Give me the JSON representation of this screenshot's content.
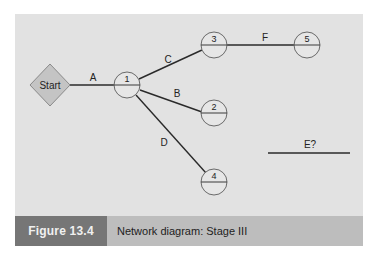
{
  "diagram": {
    "start_label": "Start",
    "nodes": [
      {
        "id": "1",
        "label": "1"
      },
      {
        "id": "2",
        "label": "2"
      },
      {
        "id": "3",
        "label": "3"
      },
      {
        "id": "4",
        "label": "4"
      },
      {
        "id": "5",
        "label": "5"
      }
    ],
    "edges": [
      {
        "label": "A",
        "from": "Start",
        "to": "1"
      },
      {
        "label": "B",
        "from": "1",
        "to": "2"
      },
      {
        "label": "C",
        "from": "1",
        "to": "3"
      },
      {
        "label": "D",
        "from": "1",
        "to": "4"
      },
      {
        "label": "F",
        "from": "3",
        "to": "5"
      },
      {
        "label": "E?",
        "from": "",
        "to": ""
      }
    ],
    "colors": {
      "background": "#e2e2e2",
      "start_fill": "#c4c4c4",
      "line": "#2a2a2a",
      "caption_bar": "#bdbdbd",
      "caption_label_bg": "#767676"
    }
  },
  "caption": {
    "figure_label": "Figure 13.4",
    "title": "Network diagram: Stage III"
  }
}
